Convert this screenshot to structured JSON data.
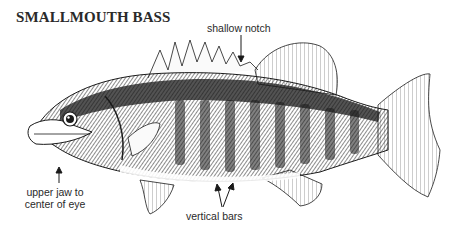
{
  "diagram": {
    "title": "SMALLMOUTH BASS",
    "annotations": {
      "notch": "shallow notch",
      "jaw_line1": "upper jaw to",
      "jaw_line2": "center of eye",
      "bars": "vertical bars"
    }
  },
  "colors": {
    "ink": "#1a1a1a",
    "background": "#ffffff"
  }
}
